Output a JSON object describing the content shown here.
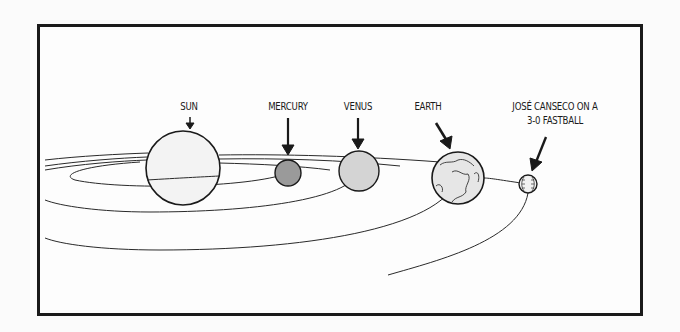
{
  "comic": {
    "labels": {
      "sun": "SUN",
      "mercury": "MERCURY",
      "venus": "VENUS",
      "earth": "EARTH",
      "canseco_line1": "JOSÉ CANSECO ON A",
      "canseco_line2": "3-0 FASTBALL"
    },
    "bodies": [
      {
        "name": "Sun",
        "cx": 183,
        "cy": 168,
        "r": 37,
        "fill": "#f3f3f3"
      },
      {
        "name": "Mercury",
        "cx": 288,
        "cy": 173,
        "r": 13,
        "fill": "#9a9a9a"
      },
      {
        "name": "Venus",
        "cx": 359,
        "cy": 171,
        "r": 20,
        "fill": "#d4d4d4"
      },
      {
        "name": "Earth",
        "cx": 458,
        "cy": 178,
        "r": 26,
        "fill": "#e6e6e6"
      },
      {
        "name": "Baseball",
        "cx": 528,
        "cy": 184,
        "r": 9,
        "fill": "#f2f2f2"
      }
    ],
    "colors": {
      "ink": "#1a1a1a",
      "panel_bg": "#fdfdfd",
      "page_bg": "#fbfbfb"
    }
  }
}
